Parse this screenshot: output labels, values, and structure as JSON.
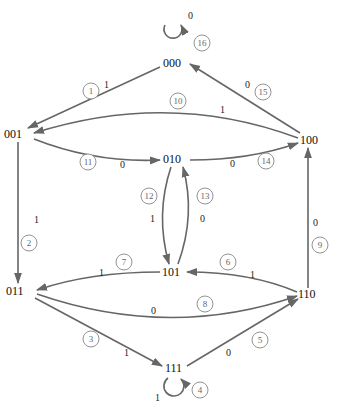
{
  "diagram": {
    "type": "state-transition-diagram",
    "nodes": [
      {
        "id": "000",
        "label": "000"
      },
      {
        "id": "001",
        "label": "001"
      },
      {
        "id": "010",
        "label": "010"
      },
      {
        "id": "100",
        "label": "100"
      },
      {
        "id": "101",
        "label": "101"
      },
      {
        "id": "011",
        "label": "011"
      },
      {
        "id": "110",
        "label": "110"
      },
      {
        "id": "111",
        "label": "111"
      }
    ],
    "edges": [
      {
        "num": "1",
        "from": "000",
        "to": "001",
        "input": "1"
      },
      {
        "num": "2",
        "from": "001",
        "to": "011",
        "input": "1"
      },
      {
        "num": "3",
        "from": "011",
        "to": "111",
        "input": "1"
      },
      {
        "num": "4",
        "from": "111",
        "to": "111",
        "input": "1"
      },
      {
        "num": "5",
        "from": "111",
        "to": "110",
        "input": "0"
      },
      {
        "num": "6",
        "from": "110",
        "to": "101",
        "input": "1"
      },
      {
        "num": "7",
        "from": "101",
        "to": "011",
        "input": "1"
      },
      {
        "num": "8",
        "from": "011",
        "to": "110",
        "input": "0"
      },
      {
        "num": "9",
        "from": "110",
        "to": "100",
        "input": "0"
      },
      {
        "num": "10",
        "from": "100",
        "to": "001",
        "input": "1"
      },
      {
        "num": "11",
        "from": "001",
        "to": "010",
        "input": "0"
      },
      {
        "num": "12",
        "from": "010",
        "to": "101",
        "input": "1"
      },
      {
        "num": "13",
        "from": "101",
        "to": "010",
        "input": "0"
      },
      {
        "num": "14",
        "from": "010",
        "to": "100",
        "input": "0"
      },
      {
        "num": "15",
        "from": "100",
        "to": "000",
        "input": "0"
      },
      {
        "num": "16",
        "from": "000",
        "to": "000",
        "input": "0"
      }
    ]
  }
}
